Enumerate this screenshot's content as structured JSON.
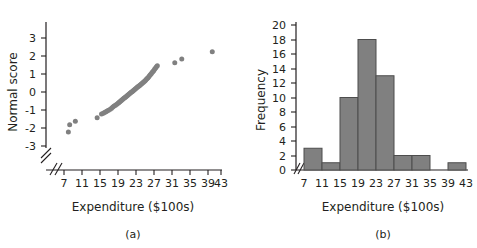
{
  "figure": {
    "background_color": "#ffffff",
    "ink_color": "#231f20",
    "data_color": "#808080",
    "bar_edge_color": "#4d4d4d"
  },
  "panels": [
    {
      "id": "a",
      "caption": "(a)",
      "chart_data": {
        "type": "scatter",
        "title": "",
        "xlabel": "Expenditure ($100s)",
        "ylabel": "Normal score",
        "xlim": [
          5,
          45
        ],
        "ylim": [
          -3.6,
          3.6
        ],
        "xticks": [
          7,
          11,
          15,
          19,
          23,
          27,
          31,
          35,
          39,
          43
        ],
        "yticks": [
          -3,
          -2,
          -1,
          0,
          1,
          2,
          3
        ],
        "x_axis_break": true,
        "y_axis_break": true,
        "grid": false,
        "legend": "none",
        "x": [
          8.0,
          8.3,
          9.6,
          14.6,
          15.6,
          16.0,
          16.3,
          16.6,
          16.9,
          17.2,
          17.6,
          17.9,
          18.2,
          18.5,
          18.8,
          19.1,
          19.4,
          19.6,
          19.8,
          20.0,
          20.2,
          20.4,
          20.6,
          20.8,
          21.0,
          21.2,
          21.4,
          21.6,
          21.8,
          22.0,
          22.2,
          22.4,
          22.6,
          22.8,
          23.0,
          23.2,
          23.4,
          23.6,
          23.8,
          24.0,
          24.2,
          24.4,
          24.6,
          24.8,
          25.0,
          25.2,
          25.4,
          25.6,
          25.8,
          26.0,
          26.2,
          26.4,
          26.6,
          26.8,
          27.0,
          27.2,
          27.4,
          27.6,
          27.8,
          28.0,
          28.2,
          28.4,
          32.4,
          34.0,
          41.0
        ],
        "y": [
          -2.22,
          -1.82,
          -1.62,
          -1.43,
          -1.22,
          -1.18,
          -1.14,
          -1.1,
          -1.06,
          -1.02,
          -0.96,
          -0.9,
          -0.84,
          -0.78,
          -0.73,
          -0.68,
          -0.63,
          -0.58,
          -0.54,
          -0.5,
          -0.46,
          -0.42,
          -0.38,
          -0.34,
          -0.3,
          -0.26,
          -0.22,
          -0.18,
          -0.14,
          -0.1,
          -0.06,
          -0.02,
          0.02,
          0.06,
          0.1,
          0.14,
          0.18,
          0.22,
          0.26,
          0.3,
          0.34,
          0.38,
          0.42,
          0.46,
          0.5,
          0.54,
          0.58,
          0.63,
          0.68,
          0.73,
          0.78,
          0.84,
          0.9,
          0.96,
          1.02,
          1.08,
          1.14,
          1.2,
          1.28,
          1.34,
          1.4,
          1.46,
          1.62,
          1.84,
          2.24
        ]
      }
    },
    {
      "id": "b",
      "caption": "(b)",
      "chart_data": {
        "type": "bar",
        "title": "",
        "xlabel": "Expenditure ($100s)",
        "ylabel": "Frequency",
        "xlim": [
          7,
          43
        ],
        "ylim": [
          0,
          21
        ],
        "xticks": [
          7,
          11,
          15,
          19,
          23,
          27,
          31,
          35,
          39,
          43
        ],
        "yticks": [
          0,
          2,
          4,
          6,
          8,
          10,
          12,
          14,
          16,
          18,
          20
        ],
        "x_axis_break": true,
        "grid": false,
        "legend": "none",
        "bin_width": 4,
        "categories": [
          "7-11",
          "11-15",
          "15-19",
          "19-23",
          "23-27",
          "27-31",
          "31-35",
          "35-39",
          "39-43"
        ],
        "bin_starts": [
          7,
          11,
          15,
          19,
          23,
          27,
          31,
          35,
          39
        ],
        "values": [
          3,
          1,
          10,
          18,
          13,
          2,
          2,
          0,
          1
        ]
      }
    }
  ]
}
